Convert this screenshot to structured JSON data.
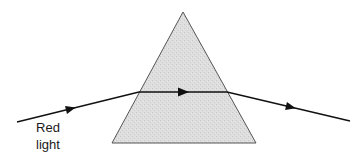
{
  "diagram": {
    "labels": {
      "light_line1": "Red",
      "light_line2": "light"
    },
    "prism": {
      "shape": "triangle",
      "apex": [
        183,
        12
      ],
      "base_left": [
        112,
        143
      ],
      "base_right": [
        256,
        143
      ],
      "fill": "#dedede",
      "stroke": "#555555"
    },
    "ray": {
      "color": "#111111",
      "segments": [
        {
          "name": "incident",
          "from": [
            17,
            122
          ],
          "to": [
            139,
            92
          ],
          "arrow_at": [
            70,
            109
          ]
        },
        {
          "name": "refracted-inside",
          "from": [
            139,
            92
          ],
          "to": [
            227,
            92
          ],
          "arrow_at": [
            185,
            92
          ]
        },
        {
          "name": "emergent",
          "from": [
            227,
            92
          ],
          "to": [
            350,
            121
          ],
          "arrow_at": [
            293,
            107
          ]
        }
      ]
    },
    "colors": {
      "background": "#ffffff",
      "prism_fill": "#dedede",
      "prism_edge": "#555555",
      "ray": "#111111",
      "text": "#1a1a1a"
    }
  }
}
